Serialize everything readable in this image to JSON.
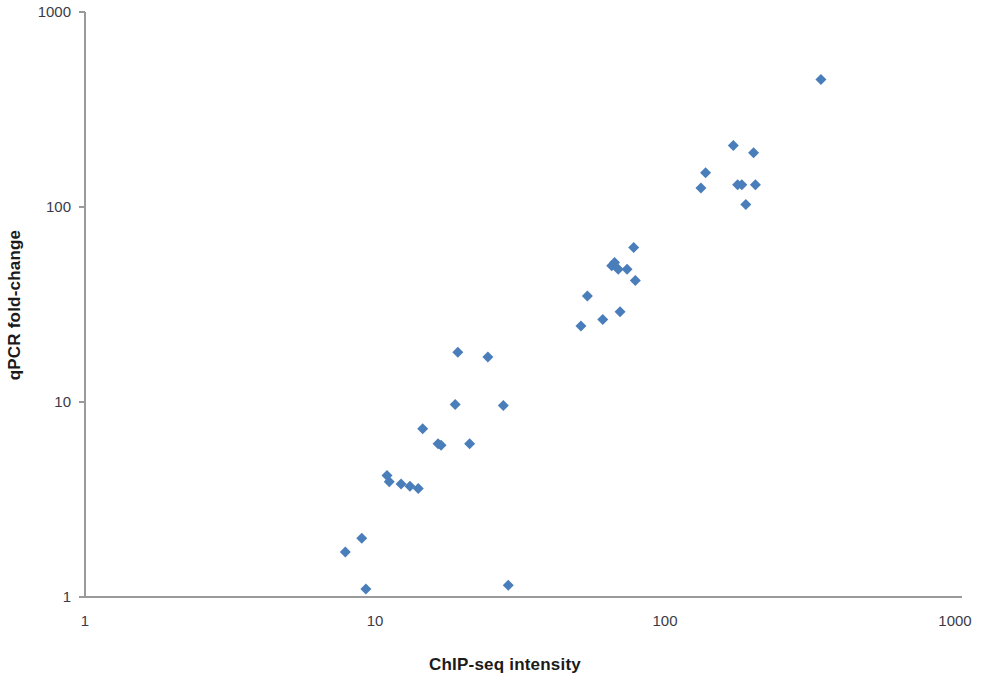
{
  "chart_data": {
    "type": "scatter",
    "title": "",
    "xlabel": "ChIP-seq intensity",
    "ylabel": "qPCR fold-change",
    "xscale": "log",
    "yscale": "log",
    "xlim": [
      1,
      1000
    ],
    "ylim": [
      1,
      1000
    ],
    "grid": false,
    "legend": null,
    "marker": {
      "shape": "diamond",
      "color": "#4a7ebb",
      "size": 11
    },
    "xticks": [
      1,
      10,
      100,
      1000
    ],
    "xtick_labels": [
      "1",
      "10",
      "100",
      "1000"
    ],
    "yticks": [
      1,
      10,
      100,
      1000
    ],
    "ytick_labels": [
      "1",
      "10",
      "100",
      "1000"
    ],
    "series": [
      {
        "name": "qPCR vs ChIP-seq",
        "points": [
          [
            7.9,
            1.7
          ],
          [
            9.0,
            2.0
          ],
          [
            9.3,
            1.1
          ],
          [
            11.0,
            4.2
          ],
          [
            11.2,
            3.9
          ],
          [
            12.3,
            3.8
          ],
          [
            13.2,
            3.7
          ],
          [
            14.1,
            3.6
          ],
          [
            14.6,
            7.3
          ],
          [
            16.5,
            6.1
          ],
          [
            16.9,
            6.0
          ],
          [
            18.9,
            9.7
          ],
          [
            19.3,
            18.0
          ],
          [
            21.2,
            6.1
          ],
          [
            24.5,
            17.0
          ],
          [
            27.7,
            9.6
          ],
          [
            28.8,
            1.15
          ],
          [
            51.3,
            24.5
          ],
          [
            54.0,
            35.0
          ],
          [
            61.0,
            26.5
          ],
          [
            65.5,
            50.0
          ],
          [
            67.0,
            52.0
          ],
          [
            69.0,
            48.0
          ],
          [
            70.0,
            29.0
          ],
          [
            74.0,
            48.0
          ],
          [
            78.0,
            62.0
          ],
          [
            79.0,
            42.0
          ],
          [
            133.0,
            125.0
          ],
          [
            138.0,
            150.0
          ],
          [
            172.0,
            207.0
          ],
          [
            178.0,
            130.0
          ],
          [
            184.0,
            130.0
          ],
          [
            190.0,
            103.0
          ],
          [
            202.0,
            190.0
          ],
          [
            205.0,
            130.0
          ],
          [
            345.0,
            450.0
          ]
        ]
      }
    ]
  },
  "axis_titles": {
    "x": "ChIP-seq intensity",
    "y": "qPCR fold-change"
  }
}
